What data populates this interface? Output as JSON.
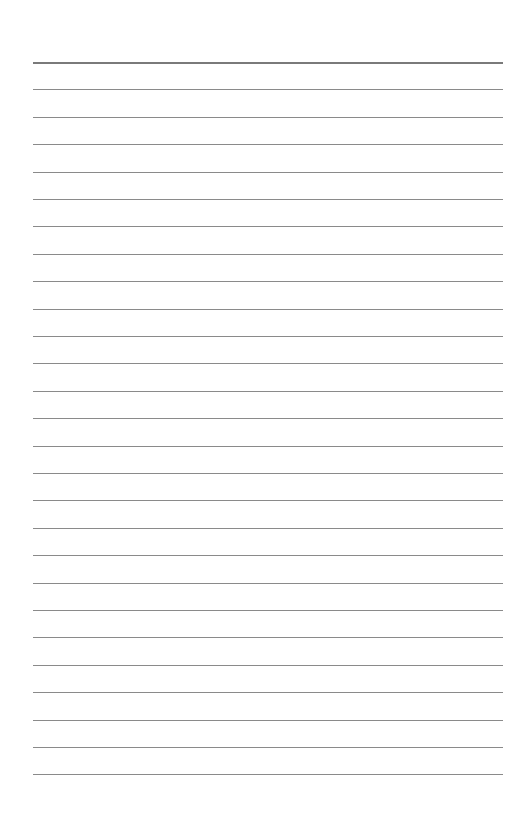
{
  "page": {
    "type": "lined-paper",
    "background": "#ffffff",
    "rule_color": "#8a8a8a",
    "header_rule_color": "#7a7a7a",
    "first_rule_y": 62,
    "rule_spacing": 27.4,
    "rule_count": 27,
    "left": 33,
    "right": 503
  }
}
